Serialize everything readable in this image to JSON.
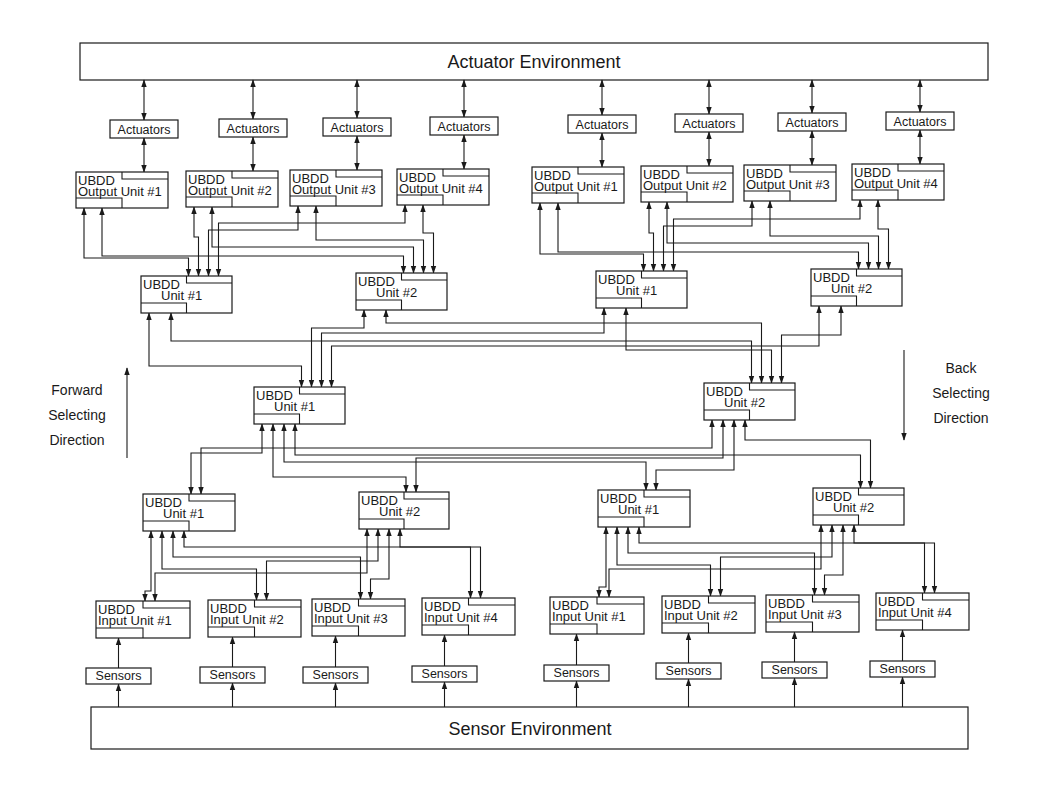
{
  "diagram": {
    "actuator_environment": {
      "label": "Actuator Environment",
      "x": 80,
      "y": 43,
      "w": 908,
      "h": 37
    },
    "sensor_environment": {
      "label": "Sensor Environment",
      "x": 91,
      "y": 707,
      "w": 877,
      "h": 42
    },
    "actuators": {
      "label": "Actuators",
      "boxes": [
        {
          "x": 110,
          "y": 120,
          "w": 68,
          "h": 18
        },
        {
          "x": 219,
          "y": 119,
          "w": 68,
          "h": 18
        },
        {
          "x": 323,
          "y": 118,
          "w": 68,
          "h": 18
        },
        {
          "x": 430,
          "y": 117,
          "w": 68,
          "h": 18
        },
        {
          "x": 568,
          "y": 115,
          "w": 68,
          "h": 18
        },
        {
          "x": 675,
          "y": 114,
          "w": 68,
          "h": 18
        },
        {
          "x": 778,
          "y": 113,
          "w": 68,
          "h": 18
        },
        {
          "x": 886,
          "y": 112,
          "w": 68,
          "h": 18
        }
      ]
    },
    "output_units": [
      {
        "title": "UBDD",
        "name": "Output Unit #1",
        "x": 76,
        "y": 172,
        "w": 92,
        "h": 36
      },
      {
        "title": "UBDD",
        "name": "Output Unit #2",
        "x": 186,
        "y": 171,
        "w": 92,
        "h": 36
      },
      {
        "title": "UBDD",
        "name": "Output Unit #3",
        "x": 290,
        "y": 170,
        "w": 92,
        "h": 36
      },
      {
        "title": "UBDD",
        "name": "Output Unit #4",
        "x": 397,
        "y": 169,
        "w": 92,
        "h": 36
      },
      {
        "title": "UBDD",
        "name": "Output Unit #1",
        "x": 532,
        "y": 167,
        "w": 92,
        "h": 36
      },
      {
        "title": "UBDD",
        "name": "Output Unit #2",
        "x": 641,
        "y": 166,
        "w": 92,
        "h": 36
      },
      {
        "title": "UBDD",
        "name": "Output Unit #3",
        "x": 744,
        "y": 165,
        "w": 92,
        "h": 36
      },
      {
        "title": "UBDD",
        "name": "Output Unit #4",
        "x": 852,
        "y": 164,
        "w": 92,
        "h": 36
      }
    ],
    "upper_units": [
      {
        "title": "UBDD",
        "name": "Unit #1",
        "x": 141,
        "y": 276,
        "w": 91,
        "h": 37
      },
      {
        "title": "UBDD",
        "name": "Unit #2",
        "x": 356,
        "y": 273,
        "w": 91,
        "h": 37
      },
      {
        "title": "UBDD",
        "name": "Unit #1",
        "x": 596,
        "y": 271,
        "w": 91,
        "h": 37
      },
      {
        "title": "UBDD",
        "name": "Unit #2",
        "x": 811,
        "y": 269,
        "w": 91,
        "h": 37
      }
    ],
    "middle_units": [
      {
        "title": "UBDD",
        "name": "Unit #1",
        "x": 254,
        "y": 387,
        "w": 91,
        "h": 37
      },
      {
        "title": "UBDD",
        "name": "Unit #2",
        "x": 704,
        "y": 383,
        "w": 91,
        "h": 37
      }
    ],
    "lower_units": [
      {
        "title": "UBDD",
        "name": "Unit #1",
        "x": 143,
        "y": 494,
        "w": 92,
        "h": 37
      },
      {
        "title": "UBDD",
        "name": "Unit #2",
        "x": 359,
        "y": 492,
        "w": 90,
        "h": 37
      },
      {
        "title": "UBDD",
        "name": "Unit #1",
        "x": 598,
        "y": 490,
        "w": 92,
        "h": 37
      },
      {
        "title": "UBDD",
        "name": "Unit #2",
        "x": 813,
        "y": 488,
        "w": 91,
        "h": 37
      }
    ],
    "input_units": [
      {
        "title": "UBDD",
        "name": "Input Unit #1",
        "x": 96,
        "y": 601,
        "w": 94,
        "h": 37
      },
      {
        "title": "UBDD",
        "name": "Input Unit #2",
        "x": 208,
        "y": 600,
        "w": 93,
        "h": 37
      },
      {
        "title": "UBDD",
        "name": "Input Unit #3",
        "x": 312,
        "y": 599,
        "w": 93,
        "h": 37
      },
      {
        "title": "UBDD",
        "name": "Input Unit #4",
        "x": 422,
        "y": 598,
        "w": 93,
        "h": 37
      },
      {
        "title": "UBDD",
        "name": "Input Unit #1",
        "x": 550,
        "y": 597,
        "w": 94,
        "h": 37
      },
      {
        "title": "UBDD",
        "name": "Input Unit #2",
        "x": 662,
        "y": 596,
        "w": 93,
        "h": 37
      },
      {
        "title": "UBDD",
        "name": "Input Unit #3",
        "x": 766,
        "y": 595,
        "w": 93,
        "h": 37
      },
      {
        "title": "UBDD",
        "name": "Input Unit #4",
        "x": 876,
        "y": 593,
        "w": 93,
        "h": 37
      }
    ],
    "sensors": {
      "label": "Sensors",
      "boxes": [
        {
          "x": 86,
          "y": 668,
          "w": 65,
          "h": 16
        },
        {
          "x": 200,
          "y": 667,
          "w": 65,
          "h": 16
        },
        {
          "x": 303,
          "y": 667,
          "w": 65,
          "h": 16
        },
        {
          "x": 412,
          "y": 666,
          "w": 65,
          "h": 16
        },
        {
          "x": 544,
          "y": 665,
          "w": 65,
          "h": 16
        },
        {
          "x": 656,
          "y": 663,
          "w": 65,
          "h": 16
        },
        {
          "x": 762,
          "y": 662,
          "w": 65,
          "h": 16
        },
        {
          "x": 870,
          "y": 661,
          "w": 65,
          "h": 16
        }
      ]
    },
    "forward_direction": {
      "lines": [
        "Forward",
        "Selecting",
        "Direction"
      ],
      "arrow": "up-arrow",
      "x": 77,
      "y": 395,
      "arrow_x": 127,
      "arrow_y1": 458,
      "arrow_y2": 368
    },
    "back_direction": {
      "lines": [
        "Back",
        "Selecting",
        "Direction"
      ],
      "arrow": "down-arrow",
      "x": 960,
      "y": 373,
      "arrow_x": 904,
      "arrow_y1": 350,
      "arrow_y2": 440
    }
  }
}
